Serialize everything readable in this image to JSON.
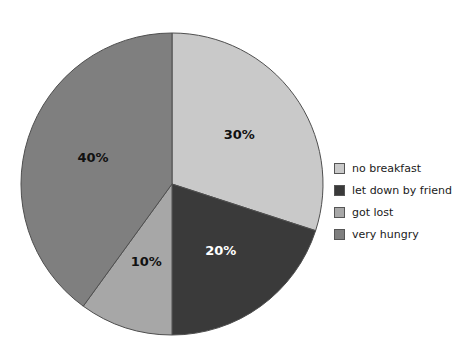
{
  "chart_data": {
    "type": "pie",
    "title": "",
    "xlabel": "",
    "ylabel": "",
    "legend_position": "right",
    "grid": false,
    "start_angle_deg": 0,
    "direction": "clockwise",
    "categories": [
      "no breakfast",
      "let down by friend",
      "got lost",
      "very hungry"
    ],
    "values": [
      30,
      20,
      10,
      40
    ],
    "value_labels": [
      "30%",
      "20%",
      "10%",
      "40%"
    ],
    "colors": [
      "#c9c9c9",
      "#3a3a3a",
      "#a7a7a7",
      "#7f7f7f"
    ],
    "label_text_colors": [
      "#111111",
      "#ffffff",
      "#111111",
      "#111111"
    ],
    "slices": [
      {
        "label": "no breakfast",
        "value": 30,
        "value_label": "30%",
        "color": "#c9c9c9",
        "label_color": "#111111"
      },
      {
        "label": "let down by friend",
        "value": 20,
        "value_label": "20%",
        "color": "#3a3a3a",
        "label_color": "#ffffff"
      },
      {
        "label": "got lost",
        "value": 10,
        "value_label": "10%",
        "color": "#a7a7a7",
        "label_color": "#111111"
      },
      {
        "label": "very hungry",
        "value": 40,
        "value_label": "40%",
        "color": "#7f7f7f",
        "label_color": "#111111"
      }
    ]
  },
  "legend": {
    "items": [
      {
        "label": "no breakfast",
        "color": "#c9c9c9"
      },
      {
        "label": "let down by friend",
        "color": "#3a3a3a"
      },
      {
        "label": "got lost",
        "color": "#a7a7a7"
      },
      {
        "label": "very hungry",
        "color": "#7f7f7f"
      }
    ]
  },
  "geometry": {
    "center_x": 172,
    "center_y": 184,
    "radius": 151,
    "label_radius_factor": 0.55,
    "outline_color": "#4f4f4f"
  }
}
